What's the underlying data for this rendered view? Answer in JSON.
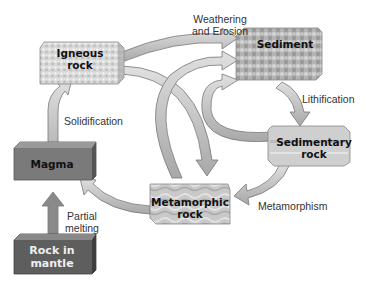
{
  "diagram": {
    "nodes": {
      "igneous": {
        "line1": "Igneous",
        "line2": "rock"
      },
      "sediment": {
        "line1": "Sediment"
      },
      "sedimentary": {
        "line1": "Sedimentary",
        "line2": "rock"
      },
      "metamorphic": {
        "line1": "Metamorphic",
        "line2": "rock"
      },
      "magma": {
        "line1": "Magma"
      },
      "mantle": {
        "line1": "Rock in",
        "line2": "mantle"
      }
    },
    "labels": {
      "weathering_1": "Weathering",
      "weathering_2": "and Erosion",
      "lithification": "Lithification",
      "solidification": "Solidification",
      "metamorphism": "Metamorphism",
      "partial_1": "Partial",
      "partial_2": "melting"
    },
    "edges": [
      {
        "from": "Igneous rock",
        "to": "Sediment",
        "label": "Weathering and Erosion"
      },
      {
        "from": "Igneous rock",
        "to": "Metamorphic rock"
      },
      {
        "from": "Metamorphic rock",
        "to": "Sediment"
      },
      {
        "from": "Sedimentary rock",
        "to": "Sediment"
      },
      {
        "from": "Sediment",
        "to": "Sedimentary rock",
        "label": "Lithification"
      },
      {
        "from": "Sedimentary rock",
        "to": "Metamorphic rock",
        "label": "Metamorphism"
      },
      {
        "from": "Metamorphic rock",
        "to": "Magma"
      },
      {
        "from": "Magma",
        "to": "Igneous rock",
        "label": "Solidification"
      },
      {
        "from": "Rock in mantle",
        "to": "Magma",
        "label": "Partial melting"
      }
    ],
    "colors": {
      "arrow_fill": "#c4c4c4",
      "arrow_stroke": "#777777",
      "magma": "#6e6e6e",
      "mantle": "#5a5a5a"
    }
  }
}
